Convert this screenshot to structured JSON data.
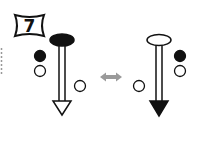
{
  "figure": {
    "number_label": "7",
    "left_arrow": {
      "head_ellipse": "filled-black",
      "tip": "hollow-triangle",
      "side_circles": [
        "filled-black",
        "hollow"
      ],
      "extra_circle": "hollow"
    },
    "swap_icon": "double-headed-arrow",
    "right_arrow": {
      "head_ellipse": "hollow",
      "tip": "filled-black-triangle",
      "side_circles": [
        "filled-black",
        "hollow"
      ],
      "extra_circle": "hollow"
    },
    "colors": {
      "ink": "#000000",
      "swap_arrow": "#9a9a9a"
    }
  }
}
